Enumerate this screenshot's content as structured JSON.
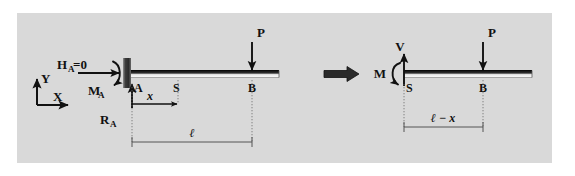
{
  "figure": {
    "background_outer": "#ffffff",
    "background_panel": "#d9d9d9",
    "ink_color": "#111111",
    "beam_dark": "#1a1a1a",
    "beam_light": "#f2f2f2",
    "wall_color": "#3a3a3a",
    "dim_line_color": "#555555"
  },
  "axes": {
    "y_label": "Y",
    "x_label": "X"
  },
  "left_diagram": {
    "name": "full-beam-free-body",
    "reactions": {
      "horizontal_label": "H",
      "horizontal_sub": "A",
      "horizontal_value": "=0",
      "moment_label": "M",
      "moment_sub": "A",
      "vertical_label": "R",
      "vertical_sub": "A"
    },
    "load": {
      "label": "P"
    },
    "points": {
      "support": "A",
      "section": "S",
      "load_point": "B"
    },
    "dimensions": {
      "x_label": "x",
      "length_label": "ℓ"
    }
  },
  "implies_symbol": "⟹",
  "right_diagram": {
    "name": "cut-section-free-body",
    "internal_forces": {
      "shear_label": "V",
      "moment_label": "M"
    },
    "load": {
      "label": "P"
    },
    "points": {
      "section": "S",
      "load_point": "B"
    },
    "dimensions": {
      "length_label": "ℓ − x"
    }
  }
}
